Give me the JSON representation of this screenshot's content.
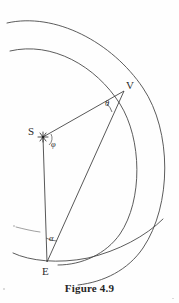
{
  "figure": {
    "caption": "Figure 4.9",
    "background_color": "#fefefe",
    "ink_color": "#3a3a3a",
    "width": 179,
    "height": 303
  },
  "points": [
    {
      "id": "S",
      "label": "S",
      "label_x": 30,
      "label_y": 130,
      "x": 43,
      "y": 137,
      "marker": "star"
    },
    {
      "id": "V",
      "label": "V",
      "label_x": 127,
      "label_y": 82,
      "x": 124,
      "y": 91,
      "marker": "none"
    },
    {
      "id": "E",
      "label": "E",
      "label_x": 42,
      "label_y": 266,
      "x": 47,
      "y": 262,
      "marker": "none"
    }
  ],
  "angles": [
    {
      "id": "theta",
      "label": "θ",
      "label_x": 106,
      "label_y": 100,
      "at_point": "V",
      "arc_radius": 16
    },
    {
      "id": "phi",
      "label": "φ",
      "label_x": 51,
      "label_y": 142,
      "at_point": "S",
      "arc_radius": 9
    },
    {
      "id": "alpha",
      "label": "α",
      "label_x": 49,
      "label_y": 235,
      "at_point": "E",
      "arc_radius": 20
    }
  ],
  "segments": [
    {
      "id": "S-V",
      "from": "S",
      "to": "V"
    },
    {
      "id": "S-E",
      "from": "S",
      "to": "E"
    },
    {
      "id": "E-V",
      "from": "E",
      "to": "V"
    }
  ],
  "arcs": [
    {
      "id": "outer-arc",
      "name": "outer-orbit-arc"
    },
    {
      "id": "inner-arc",
      "name": "inner-orbit-arc"
    }
  ]
}
